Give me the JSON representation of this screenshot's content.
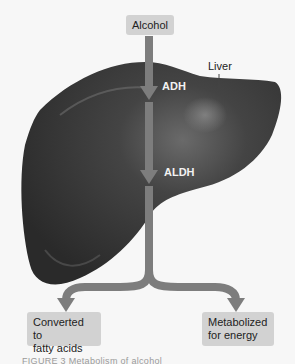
{
  "diagram": {
    "input": {
      "label": "Alcohol"
    },
    "organ": {
      "label": "Liver"
    },
    "enzymes": [
      {
        "label": "ADH"
      },
      {
        "label": "ALDH"
      }
    ],
    "outputs": [
      {
        "label_line1": "Converted to",
        "label_line2": "fatty acids"
      },
      {
        "label_line1": "Metabolized",
        "label_line2": "for energy"
      }
    ],
    "caption": "FIGURE 3   Metabolism of alcohol",
    "colors": {
      "background": "#f7f7f7",
      "liver": "#3a3a3a",
      "liver_highlight": "#6a6a6a",
      "arrow": "#7d7d7d",
      "box": "#d2d2d2",
      "enzyme_text": "#f2f2f2"
    }
  }
}
